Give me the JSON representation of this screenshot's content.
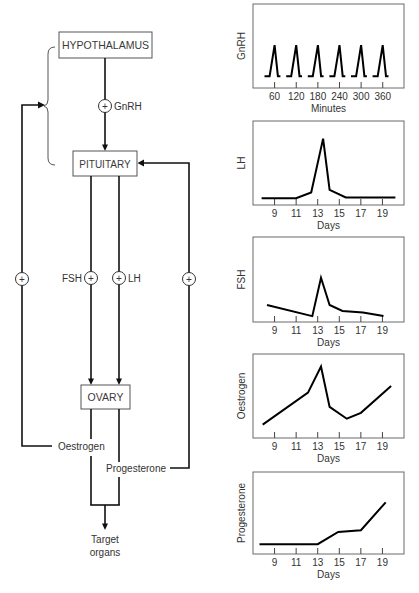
{
  "diagram": {
    "nodes": {
      "hypothalamus": "HYPOTHALAMUS",
      "pituitary": "PITUITARY",
      "ovary": "OVARY"
    },
    "hormones": {
      "gnrh": "GnRH",
      "fsh": "FSH",
      "lh": "LH",
      "oestrogen": "Oestrogen",
      "progesterone": "Progesterone"
    },
    "feedback_symbol": "+",
    "target": [
      "Target",
      "organs"
    ]
  },
  "chart_data": [
    {
      "type": "line",
      "title": "",
      "xlabel": "Minutes",
      "ylabel": "GnRH",
      "xlim": [
        0,
        419
      ],
      "ylim": [
        0,
        100
      ],
      "xticks": [
        60,
        120,
        180,
        240,
        300,
        360
      ],
      "grid": false,
      "legend": null,
      "series": [
        {
          "name": "GnRH pulses",
          "segments": [
            [
              [
                32,
                14
              ],
              [
                46,
                14
              ],
              [
                60,
                51
              ],
              [
                69,
                14
              ],
              [
                76,
                14
              ]
            ],
            [
              [
                92,
                14
              ],
              [
                106,
                14
              ],
              [
                120,
                51
              ],
              [
                129,
                14
              ],
              [
                136,
                14
              ]
            ],
            [
              [
                152,
                14
              ],
              [
                166,
                14
              ],
              [
                180,
                51
              ],
              [
                189,
                14
              ],
              [
                196,
                14
              ]
            ],
            [
              [
                212,
                14
              ],
              [
                226,
                14
              ],
              [
                240,
                51
              ],
              [
                249,
                14
              ],
              [
                256,
                14
              ]
            ],
            [
              [
                272,
                14
              ],
              [
                286,
                14
              ],
              [
                300,
                51
              ],
              [
                309,
                14
              ],
              [
                316,
                14
              ]
            ],
            [
              [
                332,
                14
              ],
              [
                346,
                14
              ],
              [
                360,
                51
              ],
              [
                369,
                14
              ],
              [
                376,
                14
              ]
            ]
          ]
        }
      ]
    },
    {
      "type": "line",
      "title": "",
      "xlabel": "Days",
      "ylabel": "LH",
      "xlim": [
        7,
        21
      ],
      "ylim": [
        0,
        100
      ],
      "xticks": [
        9,
        11,
        13,
        15,
        17,
        19
      ],
      "grid": false,
      "legend": null,
      "series": [
        {
          "name": "LH",
          "segments": [
            [
              [
                7.8,
                8
              ],
              [
                11,
                8
              ],
              [
                12.4,
                15
              ],
              [
                13.5,
                79
              ],
              [
                14.1,
                18
              ],
              [
                15.6,
                9
              ],
              [
                20.2,
                9
              ]
            ]
          ]
        }
      ]
    },
    {
      "type": "line",
      "title": "",
      "xlabel": "Days",
      "ylabel": "FSH",
      "xlim": [
        7,
        21
      ],
      "ylim": [
        0,
        100
      ],
      "xticks": [
        9,
        11,
        13,
        15,
        17,
        19
      ],
      "grid": false,
      "legend": null,
      "series": [
        {
          "name": "FSH",
          "segments": [
            [
              [
                8.3,
                20
              ],
              [
                12.5,
                7
              ],
              [
                13.3,
                52
              ],
              [
                14.1,
                20
              ],
              [
                15.3,
                13
              ],
              [
                17.2,
                11
              ],
              [
                19.1,
                7
              ]
            ]
          ]
        }
      ]
    },
    {
      "type": "line",
      "title": "",
      "xlabel": "Days",
      "ylabel": "Oestrogen",
      "xlim": [
        7,
        21
      ],
      "ylim": [
        0,
        100
      ],
      "xticks": [
        9,
        11,
        13,
        15,
        17,
        19
      ],
      "grid": false,
      "legend": null,
      "series": [
        {
          "name": "Oestrogen",
          "segments": [
            [
              [
                7.9,
                16
              ],
              [
                12.1,
                54
              ],
              [
                13.3,
                85
              ],
              [
                14.1,
                37
              ],
              [
                15.7,
                23
              ],
              [
                17.0,
                30
              ],
              [
                19.8,
                62
              ]
            ]
          ]
        }
      ]
    },
    {
      "type": "line",
      "title": "",
      "xlabel": "Days",
      "ylabel": "Progesterone",
      "xlim": [
        7,
        21
      ],
      "ylim": [
        0,
        100
      ],
      "xticks": [
        9,
        11,
        13,
        15,
        17,
        19
      ],
      "grid": false,
      "legend": null,
      "series": [
        {
          "name": "Progesterone",
          "segments": [
            [
              [
                7.6,
                12
              ],
              [
                13.0,
                12
              ],
              [
                14.9,
                27
              ],
              [
                17.0,
                29
              ],
              [
                19.3,
                63
              ]
            ]
          ]
        }
      ]
    }
  ]
}
